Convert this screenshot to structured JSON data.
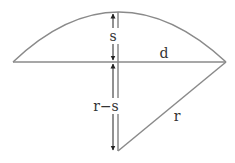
{
  "diagram": {
    "type": "circular-segment-geometry",
    "stroke_color": "#8a8a8a",
    "arrow_color": "#222222",
    "labels": {
      "sagitta": "s",
      "chord_half": "d",
      "radius_minus_sagitta": "r−s",
      "radius": "r"
    }
  }
}
